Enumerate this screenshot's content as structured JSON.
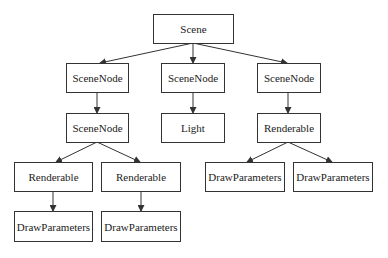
{
  "diagram": {
    "type": "tree",
    "nodes": [
      {
        "id": "scene",
        "label": "Scene"
      },
      {
        "id": "scenenode_a",
        "label": "SceneNode"
      },
      {
        "id": "scenenode_b",
        "label": "SceneNode"
      },
      {
        "id": "scenenode_c",
        "label": "SceneNode"
      },
      {
        "id": "scenenode_a_child",
        "label": "SceneNode"
      },
      {
        "id": "light",
        "label": "Light"
      },
      {
        "id": "renderable_c",
        "label": "Renderable"
      },
      {
        "id": "renderable_a1",
        "label": "Renderable"
      },
      {
        "id": "renderable_a2",
        "label": "Renderable"
      },
      {
        "id": "drawparams_c1",
        "label": "DrawParameters"
      },
      {
        "id": "drawparams_c2",
        "label": "DrawParameters"
      },
      {
        "id": "drawparams_a1",
        "label": "DrawParameters"
      },
      {
        "id": "drawparams_a2",
        "label": "DrawParameters"
      }
    ],
    "edges": [
      [
        "scene",
        "scenenode_a"
      ],
      [
        "scene",
        "scenenode_b"
      ],
      [
        "scene",
        "scenenode_c"
      ],
      [
        "scenenode_a",
        "scenenode_a_child"
      ],
      [
        "scenenode_b",
        "light"
      ],
      [
        "scenenode_c",
        "renderable_c"
      ],
      [
        "scenenode_a_child",
        "renderable_a1"
      ],
      [
        "scenenode_a_child",
        "renderable_a2"
      ],
      [
        "renderable_c",
        "drawparams_c1"
      ],
      [
        "renderable_c",
        "drawparams_c2"
      ],
      [
        "renderable_a1",
        "drawparams_a1"
      ],
      [
        "renderable_a2",
        "drawparams_a2"
      ]
    ],
    "colors": {
      "stroke": "#333333",
      "text": "#222222",
      "background": "#ffffff"
    }
  }
}
